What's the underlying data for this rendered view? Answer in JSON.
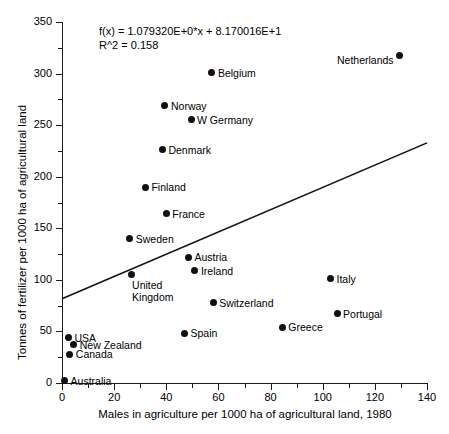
{
  "chart_data": {
    "type": "scatter",
    "title": "",
    "xlabel": "Males in agriculture per 1000 ha of agricultural land, 1980",
    "ylabel": "Tonnes of fertilizer per 1000 ha of agricultural land",
    "xlim": [
      0,
      140
    ],
    "ylim": [
      0,
      350
    ],
    "xticks": [
      0,
      20,
      40,
      60,
      80,
      100,
      120,
      140
    ],
    "yticks": [
      0,
      50,
      100,
      150,
      200,
      250,
      300,
      350
    ],
    "xtick_minor_step": 10,
    "ytick_minor_step": 25,
    "grid": false,
    "legend": "none",
    "annotations": {
      "equation": "f(x) = 1.079320E+0*x + 8.170016E+1",
      "r_squared": "R^2 = 0.158"
    },
    "fit": {
      "type": "line",
      "slope": 1.07932,
      "intercept": 81.70016,
      "x_start": 0,
      "y_start": 81.7,
      "x_end": 140,
      "y_end": 232.8
    },
    "points": [
      {
        "label": "Netherlands",
        "x": 129.5,
        "y": 318,
        "label_side": "left"
      },
      {
        "label": "Belgium",
        "x": 57.5,
        "y": 301,
        "label_side": "right"
      },
      {
        "label": "Norway",
        "x": 39.5,
        "y": 269,
        "label_side": "right"
      },
      {
        "label": "W Germany",
        "x": 49.5,
        "y": 255,
        "label_side": "right"
      },
      {
        "label": "Denmark",
        "x": 38.5,
        "y": 226,
        "label_side": "right"
      },
      {
        "label": "Finland",
        "x": 32.0,
        "y": 190,
        "label_side": "right"
      },
      {
        "label": "France",
        "x": 40.0,
        "y": 164,
        "label_side": "right"
      },
      {
        "label": "Sweden",
        "x": 26.0,
        "y": 140,
        "label_side": "right"
      },
      {
        "label": "Austria",
        "x": 48.5,
        "y": 122,
        "label_side": "right"
      },
      {
        "label": "Ireland",
        "x": 51.0,
        "y": 109,
        "label_side": "right"
      },
      {
        "label": "United\nKingdom",
        "x": 26.5,
        "y": 105,
        "label_side": "below"
      },
      {
        "label": "Italy",
        "x": 103.0,
        "y": 101,
        "label_side": "right"
      },
      {
        "label": "Switzerland",
        "x": 58.0,
        "y": 78,
        "label_side": "right"
      },
      {
        "label": "Portugal",
        "x": 105.5,
        "y": 67,
        "label_side": "right"
      },
      {
        "label": "Greece",
        "x": 84.5,
        "y": 54,
        "label_side": "right"
      },
      {
        "label": "Spain",
        "x": 47.0,
        "y": 48,
        "label_side": "right"
      },
      {
        "label": "USA",
        "x": 2.5,
        "y": 44,
        "label_side": "right"
      },
      {
        "label": "New Zealand",
        "x": 4.5,
        "y": 37,
        "label_side": "right"
      },
      {
        "label": "Canada",
        "x": 3.0,
        "y": 28,
        "label_side": "right"
      },
      {
        "label": "Australia",
        "x": 1.0,
        "y": 2,
        "label_side": "right"
      }
    ]
  }
}
